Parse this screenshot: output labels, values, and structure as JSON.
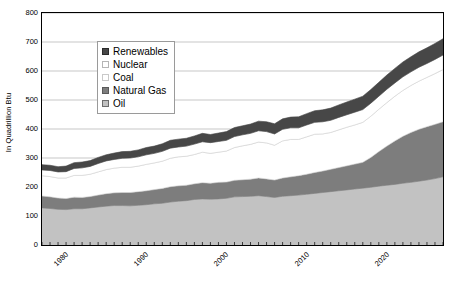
{
  "chart_data": {
    "type": "area",
    "stacked": true,
    "title": "",
    "subtitle": "",
    "xlabel": "",
    "ylabel": "In Quadrillion Btu",
    "xlim": [
      1980,
      2030
    ],
    "ylim": [
      0,
      800
    ],
    "y_ticks": [
      0,
      100,
      200,
      300,
      400,
      500,
      600,
      700,
      800
    ],
    "x_ticks": [
      1980,
      1990,
      2000,
      2010,
      2020,
      2030
    ],
    "x_tick_labels": [
      "1980",
      "1990",
      "2000",
      "2010",
      "2020",
      "2030"
    ],
    "x_minor_tick_interval": 1,
    "grid": true,
    "grid_axis": "y",
    "legend_position": "upper-left-inside",
    "legend_order_top_to_bottom": [
      "Renewables",
      "Nuclear",
      "Coal",
      "Natural Gas",
      "Oil"
    ],
    "stack_order_bottom_to_top": [
      "Oil",
      "Natural Gas",
      "Coal",
      "Nuclear",
      "Renewables"
    ],
    "x": [
      1980,
      1981,
      1982,
      1983,
      1984,
      1985,
      1986,
      1987,
      1988,
      1989,
      1990,
      1991,
      1992,
      1993,
      1994,
      1995,
      1996,
      1997,
      1998,
      1999,
      2000,
      2001,
      2002,
      2003,
      2004,
      2005,
      2006,
      2007,
      2008,
      2009,
      2010,
      2011,
      2012,
      2013,
      2014,
      2015,
      2016,
      2017,
      2018,
      2019,
      2020,
      2021,
      2022,
      2023,
      2024,
      2025,
      2026,
      2027,
      2028,
      2029,
      2030
    ],
    "series": [
      {
        "name": "Oil",
        "color": "#c2c2c2",
        "values": [
          128,
          126,
          123,
          122,
          125,
          125,
          128,
          131,
          134,
          136,
          136,
          135,
          137,
          139,
          142,
          144,
          148,
          151,
          153,
          157,
          159,
          158,
          159,
          161,
          166,
          167,
          168,
          170,
          167,
          164,
          168,
          170,
          172,
          175,
          178,
          181,
          184,
          187,
          190,
          193,
          196,
          199,
          203,
          206,
          209,
          213,
          216,
          220,
          224,
          229,
          235
        ]
      },
      {
        "name": "Natural Gas",
        "color": "#7d7d7d",
        "values": [
          41,
          40,
          39,
          38,
          40,
          39,
          39,
          41,
          43,
          44,
          45,
          46,
          47,
          48,
          49,
          51,
          53,
          53,
          53,
          54,
          56,
          55,
          57,
          56,
          57,
          58,
          59,
          61,
          61,
          60,
          63,
          65,
          67,
          69,
          72,
          74,
          77,
          80,
          83,
          86,
          89,
          103,
          119,
          135,
          150,
          162,
          172,
          179,
          184,
          187,
          190
        ]
      },
      {
        "name": "Coal",
        "color": "#ffffff",
        "values": [
          70,
          70,
          69,
          71,
          75,
          76,
          77,
          80,
          83,
          85,
          87,
          87,
          88,
          91,
          92,
          94,
          98,
          100,
          100,
          101,
          105,
          103,
          104,
          107,
          113,
          117,
          120,
          124,
          124,
          120,
          128,
          129,
          125,
          129,
          132,
          128,
          127,
          130,
          133,
          135,
          138,
          142,
          146,
          150,
          154,
          158,
          162,
          166,
          170,
          175,
          180
        ]
      },
      {
        "name": "Nuclear",
        "color": "#ffffff",
        "values": [
          20,
          21,
          21,
          22,
          24,
          26,
          27,
          29,
          30,
          30,
          31,
          32,
          32,
          33,
          33,
          34,
          35,
          34,
          35,
          36,
          36,
          37,
          37,
          37,
          38,
          38,
          38,
          39,
          39,
          39,
          40,
          40,
          40,
          41,
          41,
          42,
          42,
          43,
          43,
          44,
          44,
          45,
          45,
          46,
          46,
          47,
          47,
          48,
          48,
          49,
          50
        ]
      },
      {
        "name": "Renewables",
        "color": "#474747",
        "values": [
          18,
          18,
          18,
          19,
          20,
          20,
          20,
          21,
          21,
          22,
          23,
          23,
          24,
          25,
          25,
          26,
          27,
          27,
          27,
          28,
          29,
          28,
          29,
          30,
          31,
          31,
          32,
          33,
          34,
          35,
          36,
          37,
          38,
          39,
          40,
          41,
          42,
          43,
          44,
          45,
          46,
          47,
          48,
          49,
          50,
          51,
          52,
          53,
          54,
          55,
          56
        ]
      }
    ]
  },
  "legend": {
    "items": [
      {
        "label": "Renewables",
        "color": "#474747",
        "border": "#2b2b2b"
      },
      {
        "label": "Nuclear",
        "color": "#ffffff",
        "border": "#b5b5b5"
      },
      {
        "label": "Coal",
        "color": "#ffffff",
        "border": "#c9c9c9"
      },
      {
        "label": "Natural Gas",
        "color": "#7d7d7d",
        "border": "#5a5a5a"
      },
      {
        "label": "Oil",
        "color": "#c2c2c2",
        "border": "#6e6e6e"
      }
    ]
  },
  "axis": {
    "y_title": "In Quadrillion Btu"
  },
  "colors": {
    "plot_border": "#000000",
    "gridline": "#b9b9b9",
    "background": "#ffffff",
    "text": "#000000"
  }
}
